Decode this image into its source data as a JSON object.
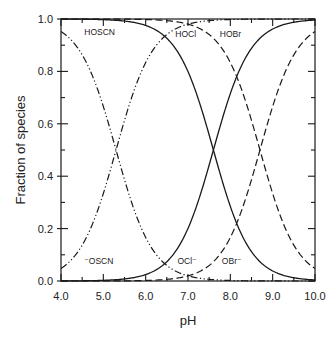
{
  "chart_data": {
    "type": "line",
    "title": "",
    "xlabel": "pH",
    "ylabel": "Fraction of species",
    "xlim": [
      4.0,
      10.0
    ],
    "ylim": [
      0.0,
      1.0
    ],
    "x_ticks": [
      "4.0",
      "5.0",
      "6.0",
      "7.0",
      "8.0",
      "9.0",
      "10.0"
    ],
    "y_ticks": [
      "0.0",
      "0.2",
      "0.4",
      "0.6",
      "0.8",
      "1.0"
    ],
    "grid": false,
    "legend": "inline labels",
    "x": [
      4.0,
      4.5,
      5.0,
      5.5,
      6.0,
      6.5,
      7.0,
      7.5,
      8.0,
      8.5,
      9.0,
      9.5,
      10.0
    ],
    "series": [
      {
        "name": "HOSCN",
        "pKa": 5.3,
        "style": "dash-dot-dot",
        "values": [
          0.952,
          0.863,
          0.666,
          0.387,
          0.166,
          0.059,
          0.02,
          0.006,
          0.002,
          0.001,
          0.0,
          0.0,
          0.0
        ]
      },
      {
        "name": "⁻OSCN",
        "pKa": 5.3,
        "style": "dash-dot-dot",
        "values": [
          0.048,
          0.137,
          0.334,
          0.613,
          0.834,
          0.941,
          0.98,
          0.994,
          0.998,
          0.999,
          1.0,
          1.0,
          1.0
        ]
      },
      {
        "name": "HOCl",
        "pKa": 7.6,
        "style": "solid",
        "values": [
          1.0,
          0.999,
          0.997,
          0.992,
          0.975,
          0.926,
          0.799,
          0.557,
          0.285,
          0.112,
          0.038,
          0.012,
          0.004
        ]
      },
      {
        "name": "OCl⁻",
        "pKa": 7.6,
        "style": "solid",
        "values": [
          0.0,
          0.001,
          0.003,
          0.008,
          0.025,
          0.074,
          0.201,
          0.443,
          0.715,
          0.888,
          0.962,
          0.988,
          0.996
        ]
      },
      {
        "name": "HOBr",
        "pKa": 8.7,
        "style": "dashed",
        "values": [
          1.0,
          1.0,
          1.0,
          0.999,
          0.998,
          0.994,
          0.98,
          0.941,
          0.834,
          0.613,
          0.334,
          0.137,
          0.048
        ]
      },
      {
        "name": "OBr⁻",
        "pKa": 8.7,
        "style": "dashed",
        "values": [
          0.0,
          0.0,
          0.0,
          0.001,
          0.002,
          0.006,
          0.02,
          0.059,
          0.166,
          0.387,
          0.666,
          0.863,
          0.952
        ]
      }
    ],
    "annotations": [
      {
        "text": "HOSCN",
        "x": 4.55,
        "y": 0.94
      },
      {
        "text": "HOCl",
        "x": 6.7,
        "y": 0.93
      },
      {
        "text": "HOBr",
        "x": 7.75,
        "y": 0.93
      },
      {
        "text": "⁻OSCN",
        "x": 4.55,
        "y": 0.065
      },
      {
        "text": "OCl⁻",
        "x": 6.75,
        "y": 0.065
      },
      {
        "text": "OBr⁻",
        "x": 7.8,
        "y": 0.065
      }
    ]
  },
  "colors": {
    "line": "#1a1a1a",
    "axis": "#1a1a1a",
    "text": "#222222",
    "background": "#ffffff"
  }
}
